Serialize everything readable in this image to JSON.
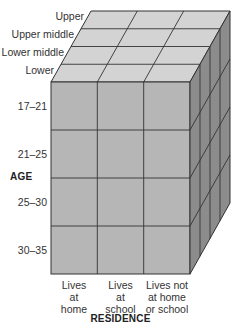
{
  "diagram": {
    "type": "3d-cube-crosstab",
    "colors": {
      "top_face": "#d3d3d3",
      "front_face": "#b6b6b6",
      "right_face": "#8c8c8c",
      "grid_line": "#333333"
    },
    "depth_axis": {
      "title": "",
      "labels": [
        "Upper",
        "Upper middle",
        "Lower middle",
        "Lower"
      ]
    },
    "vertical_axis": {
      "title": "AGE",
      "labels": [
        "17–21",
        "21–25",
        "25–30",
        "30–35"
      ]
    },
    "horizontal_axis": {
      "title": "RESIDENCE",
      "labels": [
        [
          "Lives",
          "at",
          "home"
        ],
        [
          "Lives",
          "at",
          "school"
        ],
        [
          "Lives not",
          "at home",
          "or school"
        ]
      ]
    }
  }
}
